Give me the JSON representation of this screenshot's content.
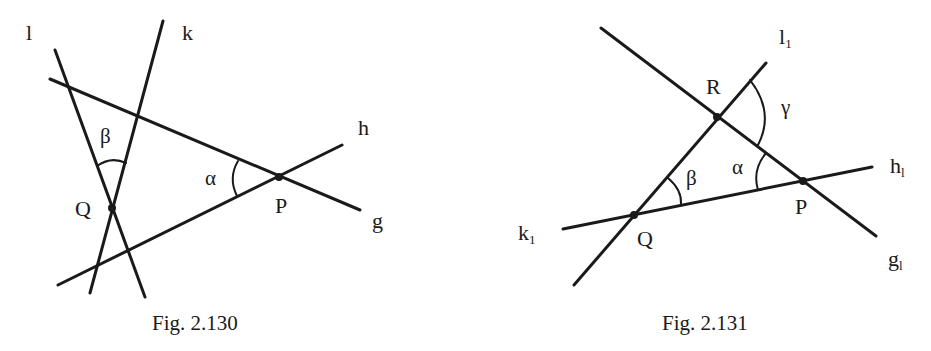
{
  "figures": [
    {
      "caption": "Fig. 2.130",
      "lines": {
        "l": "l",
        "k": "k",
        "g": "g",
        "h": "h"
      },
      "points": {
        "Q": "Q",
        "P": "P"
      },
      "angles": {
        "alpha": "α",
        "beta": "β"
      }
    },
    {
      "caption": "Fig. 2.131",
      "lines": {
        "l1": "l",
        "l1_sub": "1",
        "k1": "k",
        "k1_sub": "1",
        "g1": "g",
        "g1_sub": "l",
        "h1": "h",
        "h1_sub": "l"
      },
      "points": {
        "R": "R",
        "Q": "Q",
        "P": "P"
      },
      "angles": {
        "alpha": "α",
        "beta": "β",
        "gamma": "γ"
      }
    }
  ],
  "style": {
    "stroke": "#1a1a1a",
    "background": "#ffffff"
  }
}
